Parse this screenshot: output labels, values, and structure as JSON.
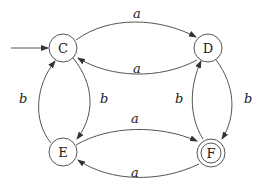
{
  "automaton": {
    "states": [
      {
        "id": "C",
        "label": "C",
        "start": true,
        "accepting": false
      },
      {
        "id": "D",
        "label": "D",
        "start": false,
        "accepting": false
      },
      {
        "id": "E",
        "label": "E",
        "start": false,
        "accepting": false
      },
      {
        "id": "F",
        "label": "F",
        "start": false,
        "accepting": true
      }
    ],
    "transitions": [
      {
        "from": "C",
        "to": "D",
        "symbol": "a"
      },
      {
        "from": "D",
        "to": "C",
        "symbol": "a"
      },
      {
        "from": "C",
        "to": "E",
        "symbol": "b"
      },
      {
        "from": "E",
        "to": "C",
        "symbol": "b"
      },
      {
        "from": "E",
        "to": "F",
        "symbol": "a"
      },
      {
        "from": "F",
        "to": "E",
        "symbol": "a"
      },
      {
        "from": "D",
        "to": "F",
        "symbol": "b"
      },
      {
        "from": "F",
        "to": "D",
        "symbol": "b"
      }
    ]
  },
  "labels": {
    "C": "C",
    "D": "D",
    "E": "E",
    "F": "F",
    "cd": "a",
    "dc": "a",
    "ce": "b",
    "ec": "b",
    "ef": "a",
    "fe": "a",
    "df": "b",
    "fd": "b"
  }
}
